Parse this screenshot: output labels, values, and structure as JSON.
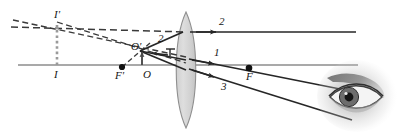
{
  "figure": {
    "type": "optics-ray-diagram",
    "width": 399,
    "height": 136,
    "background_color": "#ffffff"
  },
  "colors": {
    "axis": "#8c8c8c",
    "ray_solid": "#262626",
    "ray_dashed": "#3a3a3a",
    "object_arrow": "#4a4a4a",
    "image_arrow": "#9a9a9a",
    "lens_fill": "#d9d9d9",
    "lens_stroke": "#8f8f8f",
    "point_dot": "#111111",
    "eye_shade": "#b9b9b9"
  },
  "labels": {
    "image_tip": "I'",
    "image_base": "I",
    "object_tip": "O'",
    "object_base": "O",
    "focal_left": "F'",
    "focal_right": "F",
    "ray_one": "1",
    "ray_two": "2",
    "ray_two_incident": "2",
    "ray_three": "3"
  },
  "elements": {
    "principal_axis": "principal-axis",
    "lens": "converging-lens",
    "eye": "observer-eye",
    "object_arrow": "object-arrow",
    "image_arrow": "virtual-image-arrow"
  },
  "geometry": {
    "axis_y": 65,
    "lens_center_x": 186,
    "lens_top_y": 12,
    "lens_bottom_y": 128,
    "object_base_x": 142,
    "object_tip_y": 50,
    "image_base_x": 57,
    "image_tip_y": 22,
    "focal_left_x": 122,
    "focal_right_x": 249,
    "ray2_y": 32
  }
}
